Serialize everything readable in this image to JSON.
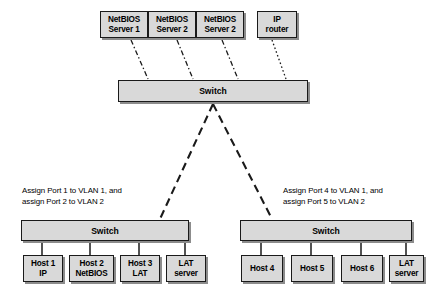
{
  "diagram": {
    "colors": {
      "node_fill": "#d9d9d9",
      "node_border": "#1a1a1a",
      "shadow": "#8c8c8c",
      "background": "#ffffff",
      "line": "#1a1a1a"
    },
    "top_nodes": [
      {
        "label": "NetBIOS\nServer 1",
        "x": 100,
        "y": 11,
        "w": 48,
        "h": 27
      },
      {
        "label": "NetBIOS\nServer 2",
        "x": 148,
        "y": 11,
        "w": 48,
        "h": 27
      },
      {
        "label": "NetBIOS\nServer 2",
        "x": 196,
        "y": 11,
        "w": 48,
        "h": 27
      },
      {
        "label": "IP\nrouter",
        "x": 257,
        "y": 11,
        "w": 40,
        "h": 27
      }
    ],
    "switches": [
      {
        "label": "Switch",
        "x": 118,
        "y": 80,
        "w": 190,
        "h": 22,
        "name": "core-switch"
      },
      {
        "label": "Switch",
        "x": 21,
        "y": 220,
        "w": 168,
        "h": 21,
        "name": "left-switch"
      },
      {
        "label": "Switch",
        "x": 240,
        "y": 220,
        "w": 172,
        "h": 21,
        "name": "right-switch"
      }
    ],
    "left_hosts": [
      {
        "label": "Host 1\nIP",
        "x": 23,
        "y": 255,
        "w": 40,
        "h": 27
      },
      {
        "label": "Host 2\nNetBIOS",
        "x": 69,
        "y": 255,
        "w": 45,
        "h": 27
      },
      {
        "label": "Host 3\nLAT",
        "x": 120,
        "y": 255,
        "w": 40,
        "h": 27
      },
      {
        "label": "LAT\nserver",
        "x": 166,
        "y": 255,
        "w": 40,
        "h": 27
      }
    ],
    "right_hosts": [
      {
        "label": "Host 4",
        "x": 241,
        "y": 255,
        "w": 42,
        "h": 27
      },
      {
        "label": "Host 5",
        "x": 291,
        "y": 255,
        "w": 42,
        "h": 27
      },
      {
        "label": "Host 6",
        "x": 341,
        "y": 255,
        "w": 42,
        "h": 27
      },
      {
        "label": "LAT\nserver",
        "x": 389,
        "y": 255,
        "w": 35,
        "h": 27
      }
    ],
    "annotations": [
      {
        "text": "Assign Port 1 to VLAN 1, and\nassign Port 2 to VLAN 2",
        "x": 22,
        "y": 186
      },
      {
        "text": "Assign Port 4 to VLAN 1, and\nassign Port 5 to VLAN 2",
        "x": 283,
        "y": 186
      }
    ],
    "access_links": [
      {
        "from": "NetBIOS Server 1",
        "to": "Switch",
        "style": "dash-dot",
        "x1": 131,
        "y1": 40,
        "x2": 148,
        "y2": 79
      },
      {
        "from": "NetBIOS Server 2",
        "to": "Switch",
        "style": "dash-dot",
        "x1": 177,
        "y1": 40,
        "x2": 193,
        "y2": 79
      },
      {
        "from": "NetBIOS Server 2",
        "to": "Switch",
        "style": "dash-dot",
        "x1": 222,
        "y1": 40,
        "x2": 238,
        "y2": 79
      },
      {
        "from": "IP router",
        "to": "Switch",
        "style": "dotted",
        "x1": 272,
        "y1": 40,
        "x2": 286,
        "y2": 79
      }
    ],
    "trunk_links": [
      {
        "from": "Switch",
        "to": "Switch",
        "style": "dashed",
        "x1": 213,
        "y1": 104,
        "x2": 160,
        "y2": 219
      },
      {
        "from": "Switch",
        "to": "Switch",
        "style": "dashed",
        "x1": 213,
        "y1": 104,
        "x2": 272,
        "y2": 219
      }
    ],
    "left_drops": [
      {
        "x": 42,
        "y1": 241,
        "y2": 255
      },
      {
        "x": 90,
        "y1": 241,
        "y2": 255
      },
      {
        "x": 139,
        "y1": 241,
        "y2": 255
      },
      {
        "x": 185,
        "y1": 241,
        "y2": 255
      }
    ],
    "right_drops": [
      {
        "x": 261,
        "y1": 241,
        "y2": 255
      },
      {
        "x": 311,
        "y1": 241,
        "y2": 255
      },
      {
        "x": 361,
        "y1": 241,
        "y2": 255
      },
      {
        "x": 406,
        "y1": 241,
        "y2": 255
      }
    ]
  }
}
